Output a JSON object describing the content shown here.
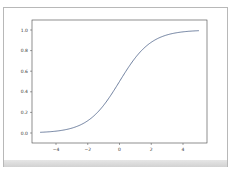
{
  "chart_data": {
    "type": "line",
    "title": "",
    "xlabel": "",
    "ylabel": "",
    "xlim": [
      -5.5,
      5.5
    ],
    "ylim": [
      -0.05,
      1.05
    ],
    "grid": false,
    "legend": null,
    "xticks": [
      "−4",
      "−2",
      "0",
      "2",
      "4"
    ],
    "yticks": [
      "0.0",
      "0.2",
      "0.4",
      "0.6",
      "0.8",
      "1.0"
    ],
    "series": [
      {
        "name": "sigmoid",
        "color": "#4a5f86",
        "x": [
          -5,
          -4,
          -3,
          -2,
          -1,
          0,
          1,
          2,
          3,
          4,
          5
        ],
        "values": [
          0.007,
          0.018,
          0.047,
          0.119,
          0.269,
          0.5,
          0.731,
          0.881,
          0.953,
          0.982,
          0.993
        ]
      }
    ]
  },
  "axis": {
    "x_labels": [
      "−4",
      "−2",
      "0",
      "2",
      "4"
    ],
    "y_labels": [
      "0.0",
      "0.2",
      "0.4",
      "0.6",
      "0.8",
      "1.0"
    ]
  }
}
